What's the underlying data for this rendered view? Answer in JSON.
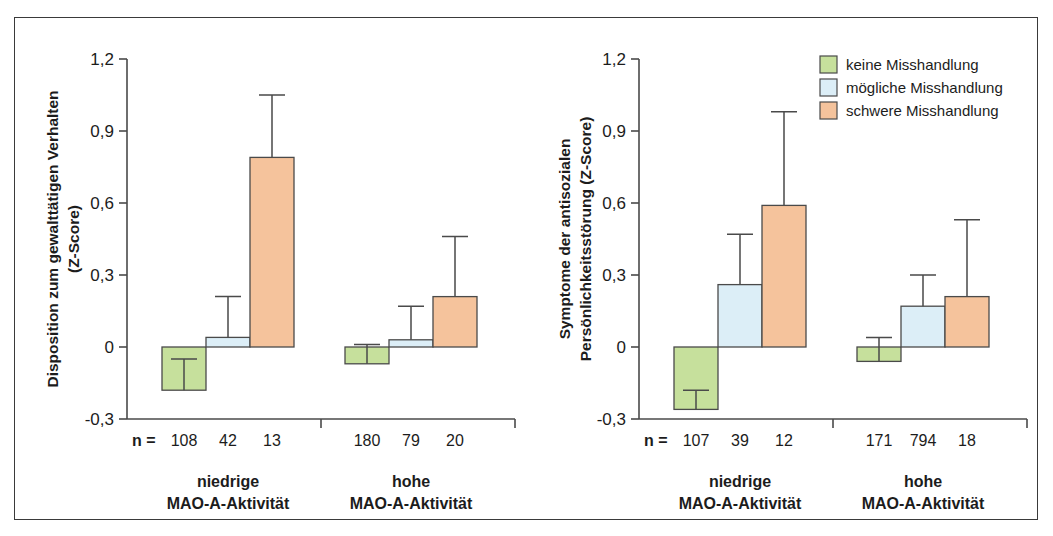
{
  "figure": {
    "border_color": "#3a3a3a",
    "background": "#ffffff"
  },
  "legend": {
    "position": "top-right",
    "items": [
      {
        "label": "keine Misshandlung",
        "color": "#c6e09c"
      },
      {
        "label": "mögliche Misshandlung",
        "color": "#dceef7"
      },
      {
        "label": "schwere Misshandlung",
        "color": "#f5c39c"
      }
    ]
  },
  "series_colors": {
    "keine": "#c6e09c",
    "moegliche": "#dceef7",
    "schwere": "#f5c39c"
  },
  "axis": {
    "ticks": [
      "1,2",
      "0,9",
      "0,6",
      "0,3",
      "0",
      "-0,3"
    ],
    "tick_values": [
      1.2,
      0.9,
      0.6,
      0.3,
      0,
      -0.3
    ],
    "ylim": [
      -0.3,
      1.2
    ],
    "n_prefix": "n ="
  },
  "groups": [
    {
      "line1": "niedrige",
      "line2": "MAO-A-Aktivität"
    },
    {
      "line1": "hohe",
      "line2": "MAO-A-Aktivität"
    }
  ],
  "chart_data": [
    {
      "type": "bar",
      "panel": "left",
      "title": "",
      "ylabel_line1": "Disposition zum gewalttätigen Verhalten",
      "ylabel_line2": "(Z-Score)",
      "xlabel": "",
      "ylim": [
        -0.3,
        1.2
      ],
      "yticks": [
        -0.3,
        0,
        0.3,
        0.6,
        0.9,
        1.2
      ],
      "ytick_labels": [
        "-0,3",
        "0",
        "0,3",
        "0,6",
        "0,9",
        "1,2"
      ],
      "grid": false,
      "legend": "top-right (shared)",
      "categories": [
        "niedrige MAO-A-Aktivität",
        "hohe MAO-A-Aktivität"
      ],
      "series": [
        {
          "name": "keine Misshandlung",
          "color": "#c6e09c",
          "values": [
            -0.18,
            -0.07
          ],
          "errors_upper": [
            0.13,
            0.08
          ],
          "n": [
            108,
            180
          ]
        },
        {
          "name": "mögliche Misshandlung",
          "color": "#dceef7",
          "values": [
            0.04,
            0.03
          ],
          "errors_upper": [
            0.17,
            0.14
          ],
          "n": [
            42,
            79
          ]
        },
        {
          "name": "schwere Misshandlung",
          "color": "#f5c39c",
          "values": [
            0.79,
            0.21
          ],
          "errors_upper": [
            0.26,
            0.25
          ],
          "n": [
            13,
            20
          ]
        }
      ]
    },
    {
      "type": "bar",
      "panel": "right",
      "title": "",
      "ylabel_line1": "Symptome der antisozialen",
      "ylabel_line2": "Persönlichkeitsstörung (Z-Score)",
      "xlabel": "",
      "ylim": [
        -0.3,
        1.2
      ],
      "yticks": [
        -0.3,
        0,
        0.3,
        0.6,
        0.9,
        1.2
      ],
      "ytick_labels": [
        "-0,3",
        "0",
        "0,3",
        "0,6",
        "0,9",
        "1,2"
      ],
      "grid": false,
      "legend": "top-right",
      "categories": [
        "niedrige MAO-A-Aktivität",
        "hohe MAO-A-Aktivität"
      ],
      "series": [
        {
          "name": "keine Misshandlung",
          "color": "#c6e09c",
          "values": [
            -0.26,
            -0.06
          ],
          "errors_upper": [
            0.08,
            0.1
          ],
          "n": [
            107,
            171
          ]
        },
        {
          "name": "mögliche Misshandlung",
          "color": "#dceef7",
          "values": [
            0.26,
            0.17
          ],
          "errors_upper": [
            0.21,
            0.13
          ],
          "n": [
            39,
            794
          ]
        },
        {
          "name": "schwere Misshandlung",
          "color": "#f5c39c",
          "values": [
            0.59,
            0.21
          ],
          "errors_upper": [
            0.39,
            0.32
          ],
          "n": [
            12,
            18
          ]
        }
      ]
    }
  ]
}
